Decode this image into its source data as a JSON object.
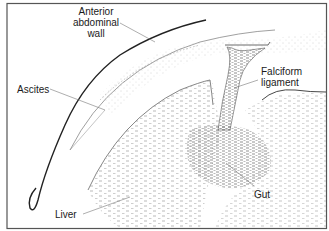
{
  "diagram": {
    "labels": {
      "anterior_abdominal_wall_line1": "Anterior",
      "anterior_abdominal_wall_line2": "abdominal",
      "anterior_abdominal_wall_line3": "wall",
      "ascites": "Ascites",
      "falciform_line1": "Falciform",
      "falciform_line2": "ligament",
      "gut": "Gut",
      "liver": "Liver"
    },
    "colors": {
      "frame": "#555555",
      "line": "#222222",
      "stipple": "#8a8a8a",
      "background": "#ffffff"
    }
  }
}
